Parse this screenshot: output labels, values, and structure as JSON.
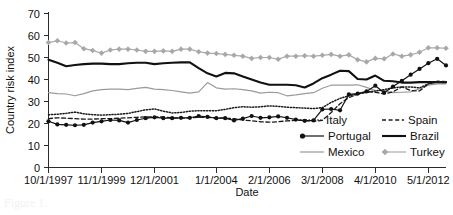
{
  "chart_data": {
    "type": "line",
    "title": "",
    "xlabel": "Date",
    "ylabel": "Country risk index",
    "ylim": [
      0,
      70
    ],
    "ytick_step": 10,
    "yticks": [
      0,
      10,
      20,
      30,
      40,
      50,
      60,
      70
    ],
    "grid": false,
    "legend_position": "inside-bottom-right",
    "x_tick_labels": [
      "10/1/1997",
      "11/1/1999",
      "12/1/2001",
      "1/1/2004",
      "2/1/2006",
      "3/1/2008",
      "4/1/2010",
      "5/1/2012"
    ],
    "x_tick_indices": [
      0,
      6,
      12,
      19,
      25,
      31,
      37,
      43
    ],
    "n_points": 46,
    "series": [
      {
        "name": "Italy",
        "style": "dotted",
        "color": "#1a1a1a",
        "marker": "none",
        "values": [
          24.0,
          24.2,
          24.6,
          25.2,
          24.4,
          24.0,
          23.8,
          24.0,
          24.2,
          24.6,
          25.4,
          26.2,
          26.6,
          25.6,
          24.8,
          25.0,
          25.6,
          25.8,
          25.8,
          25.8,
          26.4,
          27.2,
          27.6,
          27.4,
          27.6,
          28.0,
          27.8,
          27.4,
          27.2,
          27.0,
          26.8,
          27.2,
          29.6,
          31.4,
          32.6,
          33.4,
          34.2,
          34.8,
          35.4,
          36.2,
          36.6,
          36.6,
          36.2,
          38.0,
          38.8,
          38.6
        ]
      },
      {
        "name": "Spain",
        "style": "dashed",
        "color": "#1a1a1a",
        "marker": "none",
        "values": [
          22.2,
          22.6,
          22.4,
          22.2,
          22.0,
          22.0,
          22.2,
          22.2,
          22.4,
          22.6,
          22.8,
          23.0,
          23.0,
          23.0,
          22.6,
          22.4,
          22.6,
          22.8,
          22.8,
          22.6,
          22.4,
          22.2,
          21.6,
          21.2,
          20.8,
          20.6,
          20.8,
          21.2,
          21.4,
          21.4,
          21.0,
          21.4,
          25.0,
          29.0,
          31.8,
          33.2,
          34.4,
          34.2,
          33.4,
          34.4,
          36.6,
          35.0,
          34.8,
          38.0,
          39.2,
          39.0
        ]
      },
      {
        "name": "Portugal",
        "style": "solid",
        "color": "#111111",
        "marker": "circle",
        "values": [
          21.0,
          19.6,
          19.4,
          19.2,
          19.4,
          20.4,
          21.0,
          21.6,
          21.4,
          20.4,
          21.6,
          22.4,
          22.8,
          22.4,
          22.4,
          22.6,
          22.6,
          23.4,
          23.0,
          22.4,
          22.4,
          21.4,
          22.2,
          23.4,
          22.6,
          22.8,
          23.2,
          22.6,
          21.8,
          21.2,
          21.4,
          26.4,
          26.6,
          26.0,
          33.2,
          33.6,
          34.6,
          37.2,
          34.0,
          36.8,
          39.4,
          42.2,
          44.8,
          47.4,
          49.4,
          46.4
        ]
      },
      {
        "name": "Brazil",
        "style": "solid-thick",
        "color": "#111111",
        "marker": "none",
        "values": [
          49.0,
          47.6,
          46.0,
          46.6,
          47.0,
          47.2,
          47.2,
          47.0,
          47.0,
          47.4,
          47.6,
          47.6,
          47.0,
          47.4,
          47.6,
          47.8,
          47.8,
          45.2,
          42.8,
          41.4,
          43.0,
          42.8,
          41.4,
          40.0,
          38.6,
          37.6,
          37.6,
          37.6,
          37.4,
          36.4,
          38.2,
          40.6,
          42.2,
          44.0,
          43.8,
          40.2,
          40.0,
          41.8,
          39.4,
          39.2,
          38.6,
          38.6,
          38.8,
          38.8,
          38.8,
          38.8
        ]
      },
      {
        "name": "Mexico",
        "style": "solid",
        "color": "#9a9a9a",
        "marker": "none",
        "values": [
          34.0,
          33.6,
          33.4,
          32.6,
          33.6,
          34.8,
          35.4,
          35.6,
          35.6,
          35.4,
          36.0,
          36.4,
          35.6,
          35.4,
          35.0,
          34.4,
          33.8,
          34.4,
          38.6,
          36.2,
          35.6,
          35.8,
          35.4,
          34.8,
          33.8,
          34.2,
          34.0,
          32.6,
          33.0,
          33.6,
          34.0,
          36.0,
          37.4,
          37.4,
          37.4,
          37.6,
          36.4,
          35.0,
          34.8,
          34.0,
          34.2,
          34.4,
          35.8,
          37.4,
          38.0,
          38.0
        ]
      },
      {
        "name": "Turkey",
        "style": "solid",
        "color": "#a8a8a8",
        "marker": "diamond",
        "values": [
          56.8,
          57.6,
          56.6,
          56.8,
          54.0,
          53.2,
          52.0,
          53.4,
          53.8,
          53.8,
          53.4,
          52.8,
          52.8,
          53.0,
          52.8,
          53.8,
          53.8,
          52.6,
          52.0,
          51.8,
          51.4,
          51.0,
          50.6,
          49.6,
          50.0,
          50.0,
          49.2,
          50.6,
          50.6,
          50.8,
          50.6,
          51.0,
          51.4,
          50.6,
          51.2,
          49.0,
          48.0,
          49.6,
          49.4,
          51.6,
          50.6,
          51.2,
          52.4,
          54.4,
          54.4,
          54.2
        ]
      }
    ]
  },
  "axes": {
    "y_title": "Country risk index",
    "x_title": "Date"
  },
  "legend": {
    "entries": [
      {
        "label": "Italy",
        "key": "italy"
      },
      {
        "label": "Spain",
        "key": "spain"
      },
      {
        "label": "Portugal",
        "key": "portugal"
      },
      {
        "label": "Brazil",
        "key": "brazil"
      },
      {
        "label": "Mexico",
        "key": "mexico"
      },
      {
        "label": "Turkey",
        "key": "turkey"
      }
    ]
  },
  "caption": {
    "text": "Figure 1."
  }
}
